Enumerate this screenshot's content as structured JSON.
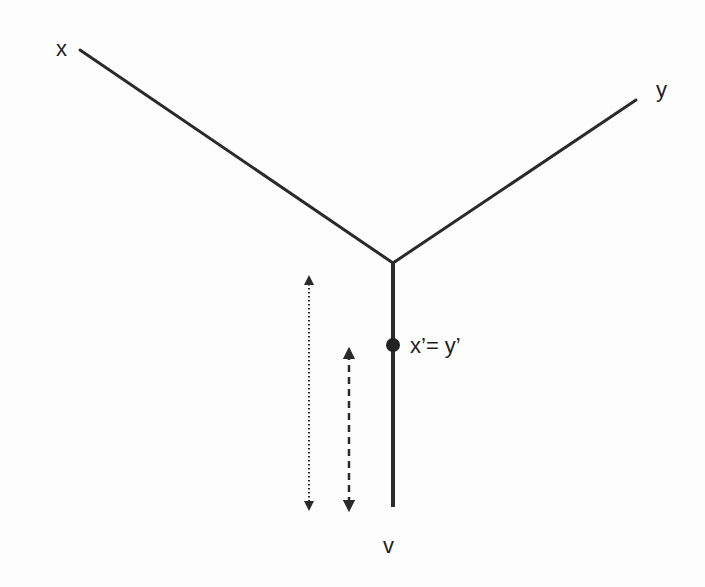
{
  "diagram": {
    "type": "tree-junction",
    "colors": {
      "line": "#2a2a2a",
      "text": "#1e1e1e",
      "background": "#fdfdfd"
    },
    "nodes": [
      {
        "id": "x",
        "label": "x",
        "x": 80,
        "y": 50,
        "label_x": 62,
        "label_y": 56
      },
      {
        "id": "y",
        "label": "y",
        "x": 636,
        "y": 100,
        "label_x": 656,
        "label_y": 97
      },
      {
        "id": "junction",
        "label": "",
        "x": 393,
        "y": 263
      },
      {
        "id": "v",
        "label": "v",
        "x": 393,
        "y": 507,
        "label_x": 384,
        "label_y": 553
      },
      {
        "id": "xy_prime",
        "label": "x’= y’",
        "x": 393,
        "y": 345,
        "label_x": 410,
        "label_y": 353
      }
    ],
    "edges": [
      {
        "from": "x",
        "to": "junction",
        "style": "solid"
      },
      {
        "from": "y",
        "to": "junction",
        "style": "solid"
      },
      {
        "from": "junction",
        "to": "v",
        "style": "solid"
      }
    ],
    "arrows": [
      {
        "name": "dotted-double-arrow",
        "style": "dotted",
        "x": 309,
        "y1": 275,
        "y2": 511
      },
      {
        "name": "dashed-double-arrow",
        "style": "dashed",
        "x": 349,
        "y1": 348,
        "y2": 511
      }
    ],
    "labels": {
      "x": "x",
      "y": "y",
      "v": "v",
      "point": "x’= y’"
    }
  }
}
